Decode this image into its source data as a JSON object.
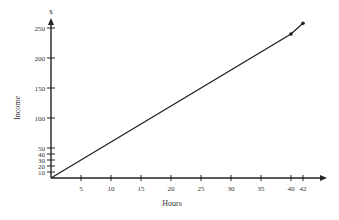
{
  "chart_data": {
    "type": "line",
    "title": "",
    "xlabel": "Hours",
    "ylabel": "Income",
    "y_unit": "$",
    "xlim": [
      0,
      44
    ],
    "ylim": [
      0,
      260
    ],
    "grid": false,
    "legend": null,
    "x_ticks": [
      5,
      10,
      15,
      20,
      25,
      30,
      35,
      40,
      42
    ],
    "y_ticks": [
      10,
      20,
      30,
      40,
      50,
      100,
      150,
      200,
      250
    ],
    "series": [
      {
        "name": "Income",
        "x": [
          0,
          40,
          42
        ],
        "y": [
          0,
          240,
          258
        ],
        "markers_at": [
          40,
          42
        ]
      }
    ],
    "annotations": [
      "Slope changes at 40 hours (overtime rate)"
    ]
  }
}
